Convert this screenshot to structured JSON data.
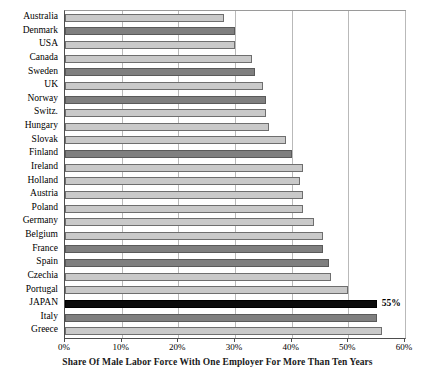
{
  "chart_data": {
    "type": "bar",
    "orientation": "horizontal",
    "title": "",
    "xlabel": "Share Of Male Labor Force With One Employer For More Than Ten Years",
    "ylabel": "",
    "xlim": [
      0,
      60
    ],
    "xtick_labels": [
      "0%",
      "10%",
      "20%",
      "30%",
      "40%",
      "50%",
      "60%"
    ],
    "xticks": [
      0,
      10,
      20,
      30,
      40,
      50,
      60
    ],
    "grid": true,
    "legend": null,
    "categories": [
      "Australia",
      "Denmark",
      "USA",
      "Canada",
      "Sweden",
      "UK",
      "Norway",
      "Switz.",
      "Hungary",
      "Slovak",
      "Finland",
      "Ireland",
      "Holland",
      "Austria",
      "Poland",
      "Germany",
      "Belgium",
      "France",
      "Spain",
      "Czechia",
      "Portugal",
      "JAPAN",
      "Italy",
      "Greece"
    ],
    "values": [
      28,
      30,
      30,
      33,
      33.5,
      35,
      35.5,
      35.5,
      36,
      39,
      40,
      42,
      41.5,
      42,
      42,
      44,
      45.5,
      45.5,
      46.5,
      47,
      50,
      55,
      55,
      56
    ],
    "bar_styles": [
      "light",
      "dark",
      "light",
      "light",
      "dark",
      "light",
      "dark",
      "light",
      "light",
      "light",
      "dark",
      "light",
      "light",
      "light",
      "light",
      "light",
      "light",
      "dark",
      "dark",
      "light",
      "light",
      "black",
      "dark",
      "light"
    ],
    "data_labels": [
      "",
      "",
      "",
      "",
      "",
      "",
      "",
      "",
      "",
      "",
      "",
      "",
      "",
      "",
      "",
      "",
      "",
      "",
      "",
      "",
      "",
      "55%",
      "",
      ""
    ],
    "highlight_category": "JAPAN",
    "colors": {
      "bar_light": "#c9c9c9",
      "bar_dark": "#7f7f7f",
      "bar_black": "#0b0b0b",
      "bar_border": "#6e6e6e",
      "gridline": "#b9b9b9",
      "axis": "#4d4d4d",
      "text": "#000000",
      "background": "#ffffff"
    }
  }
}
